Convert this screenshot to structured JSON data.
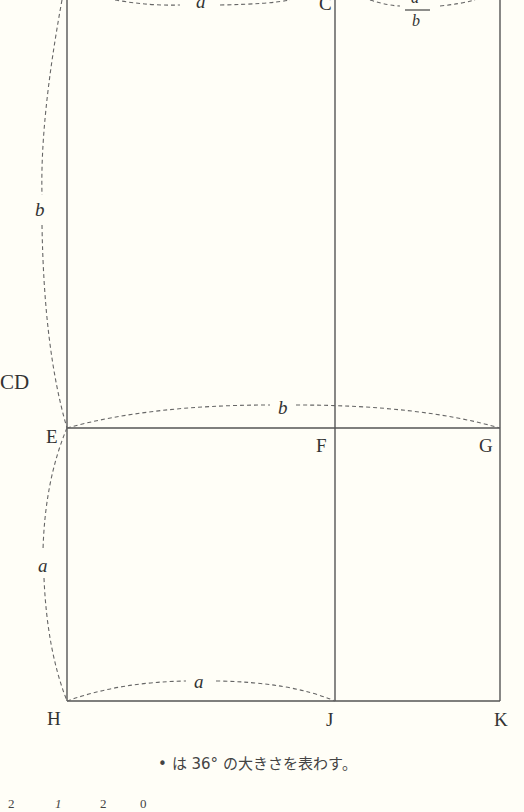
{
  "figure": {
    "points": {
      "C": "C",
      "E": "E",
      "F": "F",
      "G": "G",
      "H": "H",
      "J": "J",
      "K": "K"
    },
    "partial_label_left": "CD",
    "segment_labels": {
      "top_left": "a",
      "top_right_numerator": "a",
      "top_right_denominator": "b",
      "left_upper": "b",
      "left_lower": "a",
      "EG": "b",
      "HJ": "a"
    },
    "note": "• は 36° の大きさを表わす。",
    "cut_off_bottom_text": [
      "2",
      "1",
      "2",
      "0"
    ]
  }
}
